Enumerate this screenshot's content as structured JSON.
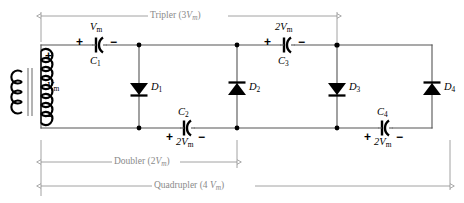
{
  "diagram": {
    "colors": {
      "wire": "#555555",
      "component": "#000000",
      "annotation": "#8a8a8a",
      "background": "#ffffff"
    },
    "source": {
      "name": "transformer",
      "secondary_label": "V",
      "secondary_label_sub": "m",
      "plus_sign": "+",
      "minus_sign": "−"
    },
    "capacitors": [
      {
        "id": "C1",
        "name": "C",
        "sub": "1",
        "value": "V",
        "value_sub": "m",
        "plus": "+",
        "minus": "−",
        "label_position": "below",
        "value_position": "above"
      },
      {
        "id": "C2",
        "name": "C",
        "sub": "2",
        "value": "2V",
        "value_sub": "m",
        "plus": "+",
        "minus": "−",
        "label_position": "above",
        "value_position": "below"
      },
      {
        "id": "C3",
        "name": "C",
        "sub": "3",
        "value": "2V",
        "value_sub": "m",
        "plus": "+",
        "minus": "−",
        "label_position": "below",
        "value_position": "above"
      },
      {
        "id": "C4",
        "name": "C",
        "sub": "4",
        "value": "2V",
        "value_sub": "m",
        "plus": "+",
        "minus": "−",
        "label_position": "above",
        "value_position": "below"
      }
    ],
    "diodes": [
      {
        "id": "D1",
        "name": "D",
        "sub": "1",
        "direction": "down"
      },
      {
        "id": "D2",
        "name": "D",
        "sub": "2",
        "direction": "up"
      },
      {
        "id": "D3",
        "name": "D",
        "sub": "3",
        "direction": "down"
      },
      {
        "id": "D4",
        "name": "D",
        "sub": "4",
        "direction": "up"
      }
    ],
    "spans": [
      {
        "id": "tripler",
        "prefix": "Tripler (3",
        "var": "V",
        "var_sub": "m",
        "suffix": ")"
      },
      {
        "id": "doubler",
        "prefix": "Doubler (2",
        "var": "V",
        "var_sub": "m",
        "suffix": ")"
      },
      {
        "id": "quadrupler",
        "prefix": "Quadrupler (4",
        "var": "V",
        "var_sub": "m",
        "suffix": ")"
      }
    ]
  }
}
